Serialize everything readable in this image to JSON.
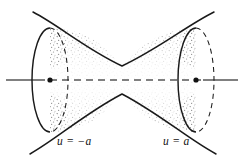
{
  "figure": {
    "kind": "hyperboloid-of-one-sheet-diagram",
    "title": "",
    "background_color": "#ffffff",
    "ink_color": "#1a1a1a",
    "axis_color": "#808080",
    "stipple_color": "#8a8a8a",
    "labels": [
      {
        "id": "left-cap",
        "text": "u = −a",
        "x": 57,
        "y": 145
      },
      {
        "id": "right-cap",
        "text": "u = a",
        "x": 163,
        "y": 145
      }
    ],
    "axis": {
      "name": "axis-of-revolution",
      "y": 80,
      "x_start": 6,
      "x_end": 238,
      "solid_segments": [
        [
          6,
          38
        ],
        [
          205,
          238
        ]
      ],
      "dashed_segment": [
        38,
        205
      ],
      "dash_pattern": "7 5",
      "stroke_width": 2.1
    },
    "points": [
      {
        "id": "left-center",
        "x": 50,
        "y": 80,
        "r": 2.6
      },
      {
        "id": "right-center",
        "x": 196,
        "y": 80,
        "r": 2.6
      }
    ],
    "caps": [
      {
        "id": "left-ellipse",
        "center_x": 50,
        "center_y": 80,
        "rx": 18,
        "ry": 52,
        "front_is": "left",
        "u_value": "-a"
      },
      {
        "id": "right-ellipse",
        "center_x": 196,
        "center_y": 80,
        "rx": 18,
        "ry": 52,
        "front_is": "left",
        "u_value": "a"
      }
    ],
    "hyperbolas": {
      "waist_half_width": 26,
      "top_silhouette": "upper branch bending down to waist at center",
      "bottom_silhouette": "lower branch bending up to waist at center",
      "extends_past_caps": true
    },
    "shading": {
      "style": "stipple",
      "density": "dense near silhouette edges, sparse at center"
    }
  }
}
